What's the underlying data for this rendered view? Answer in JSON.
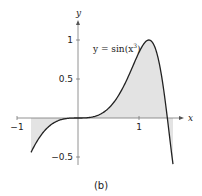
{
  "chart_data": {
    "type": "area",
    "title": "",
    "function_label": "y = sin(x³)",
    "label_parts": {
      "lhs": "y = sin(x",
      "exp": "3",
      "rhs": ")"
    },
    "xlabel": "x",
    "ylabel": "y",
    "x_ticks": [
      {
        "value": -1,
        "label": "−1"
      },
      {
        "value": 1,
        "label": "1"
      }
    ],
    "y_ticks": [
      {
        "value": 1,
        "label": "1"
      },
      {
        "value": 0.5,
        "label": "0.5"
      },
      {
        "value": -0.5,
        "label": "−0.5"
      }
    ],
    "domain": [
      -0.77,
      1.557
    ],
    "shaded_region": [
      -0.77,
      1.557
    ],
    "xlim": [
      -1.1,
      1.75
    ],
    "ylim": [
      -0.65,
      1.25
    ],
    "grid": false,
    "sample_points": [
      {
        "x": -0.77,
        "y": -0.44
      },
      {
        "x": -0.5,
        "y": -0.12
      },
      {
        "x": 0,
        "y": 0
      },
      {
        "x": 0.5,
        "y": 0.12
      },
      {
        "x": 0.8,
        "y": 0.48
      },
      {
        "x": 1.0,
        "y": 0.84
      },
      {
        "x": 1.16,
        "y": 1.0
      },
      {
        "x": 1.3,
        "y": 0.81
      },
      {
        "x": 1.4646,
        "y": 0
      },
      {
        "x": 1.557,
        "y": -0.6
      }
    ],
    "colors": {
      "curve": "#222222",
      "fill": "#e3e3e3",
      "axis": "#777777"
    }
  },
  "caption": "(b)"
}
